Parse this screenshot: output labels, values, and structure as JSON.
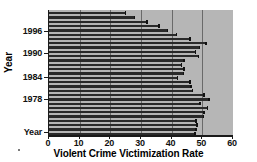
{
  "chart_data": {
    "type": "bar",
    "orientation": "horizontal",
    "title": "",
    "xlabel": "Violent Crime Victimization Rate",
    "ylabel": "Year",
    "xlim": [
      0,
      60
    ],
    "xticks": [
      0,
      10,
      20,
      30,
      40,
      50,
      60
    ],
    "xtick_labels": [
      "0",
      "10",
      "20",
      "30",
      "40",
      "50",
      "60"
    ],
    "yticks": [
      1996,
      1990,
      1984,
      1978
    ],
    "ytick_labels": [
      "1996",
      "1990",
      "1984",
      "1978",
      "Year"
    ],
    "grid": true,
    "grid_axis": "x",
    "legend": null,
    "categories": [
      "2001",
      "2000",
      "1999",
      "1998",
      "1997",
      "1996",
      "1995",
      "1994",
      "1993",
      "1992",
      "1991",
      "1990",
      "1989",
      "1988",
      "1987",
      "1986",
      "1985",
      "1984",
      "1983",
      "1982",
      "1981",
      "1980",
      "1979",
      "1978",
      "1977",
      "1976",
      "1975",
      "1974",
      "1973"
    ],
    "values": [
      25.1,
      27.9,
      32.1,
      36.0,
      38.8,
      41.6,
      46.1,
      51.2,
      49.1,
      47.9,
      48.8,
      44.1,
      43.3,
      44.1,
      44.0,
      42.0,
      46.1,
      46.4,
      46.8,
      50.7,
      52.3,
      49.4,
      51.7,
      50.6,
      50.4,
      48.0,
      48.4,
      48.0,
      47.7
    ],
    "bar_color": "#2a2a2a",
    "plot_background": "#b6b6b6",
    "gridline_color": "#6a6a6a",
    "axis_color": "#1a1a1a"
  },
  "axis": {
    "x_title": "Violent Crime Victimization Rate",
    "y_title": "Year",
    "x_tick_labels": [
      "0",
      "10",
      "20",
      "30",
      "40",
      "50",
      "60"
    ],
    "y_tick_labels": [
      "1996",
      "1990",
      "1984",
      "1978",
      "Year"
    ]
  }
}
